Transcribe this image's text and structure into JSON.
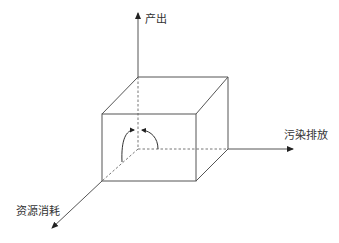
{
  "diagram": {
    "type": "3d-axes-cube",
    "axes": {
      "vertical": {
        "label": "产出"
      },
      "horizontal": {
        "label": "污染排放"
      },
      "diagonal": {
        "label": "资源消耗"
      }
    },
    "colors": {
      "line": "#555555",
      "dashed": "#777777",
      "text": "#333333",
      "background": "#ffffff"
    }
  }
}
